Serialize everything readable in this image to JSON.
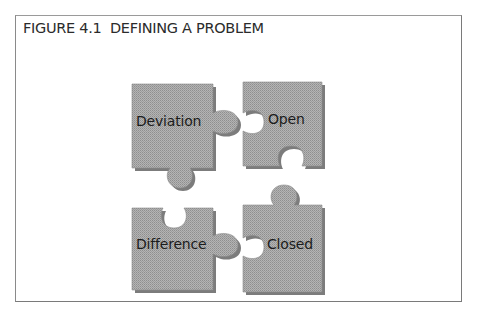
{
  "figure": {
    "title": "FIGURE 4.1  DEFINING A PROBLEM"
  },
  "pieces": [
    {
      "label": "Deviation",
      "position": "top-left"
    },
    {
      "label": "Open",
      "position": "top-right"
    },
    {
      "label": "Difference",
      "position": "bottom-left"
    },
    {
      "label": "Closed",
      "position": "bottom-right"
    }
  ],
  "colors": {
    "piece_fill": "#a8a8a8",
    "piece_shadow": "#7c7c7c",
    "border": "#8a8a8a",
    "text": "#2b2b2b"
  }
}
